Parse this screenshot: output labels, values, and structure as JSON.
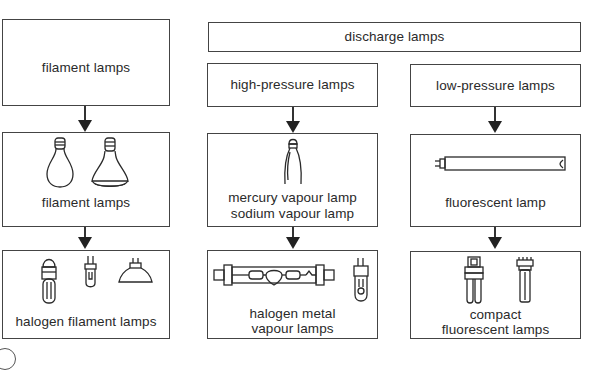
{
  "diagram": {
    "type": "hierarchy",
    "columns": [
      {
        "id": "filament",
        "header": "filament lamps",
        "boxes": [
          {
            "label_lines": [
              "filament lamps"
            ],
            "icons": [
              "standard-bulb-icon",
              "reflector-bulb-icon"
            ]
          },
          {
            "label_lines": [
              "halogen filament lamps"
            ],
            "icons": [
              "halogen-capsule-with-base-icon",
              "halogen-pin-capsule-icon",
              "halogen-reflector-icon"
            ]
          }
        ]
      },
      {
        "id": "high-pressure",
        "parent": "discharge lamps",
        "header": "high-pressure lamps",
        "boxes": [
          {
            "label_lines": [
              "mercury vapour lamp",
              "sodium vapour lamp"
            ],
            "icons": [
              "ellipsoid-discharge-bulb-icon"
            ]
          },
          {
            "label_lines": [
              "halogen metal",
              "vapour lamps"
            ],
            "icons": [
              "double-ended-metal-halide-icon",
              "single-ended-metal-halide-icon"
            ]
          }
        ]
      },
      {
        "id": "low-pressure",
        "parent": "discharge lamps",
        "header": "low-pressure lamps",
        "boxes": [
          {
            "label_lines": [
              "fluorescent lamp"
            ],
            "icons": [
              "fluorescent-tube-icon"
            ]
          },
          {
            "label_lines": [
              "compact",
              "fluorescent lamps"
            ],
            "icons": [
              "compact-fluorescent-twin-tube-icon",
              "compact-fluorescent-single-tube-icon"
            ]
          }
        ]
      }
    ],
    "group_header": "discharge lamps"
  },
  "labels": {
    "filament_header": "filament lamps",
    "discharge_header": "discharge lamps",
    "high_pressure": "high-pressure lamps",
    "low_pressure": "low-pressure lamps",
    "filament_lamps": "filament lamps",
    "halogen_filament": "halogen filament lamps",
    "mercury": "mercury vapour lamp",
    "sodium": "sodium vapour lamp",
    "halogen_metal_1": "halogen metal",
    "halogen_metal_2": "vapour lamps",
    "fluorescent": "fluorescent lamp",
    "compact_1": "compact",
    "compact_2": "fluorescent lamps"
  }
}
